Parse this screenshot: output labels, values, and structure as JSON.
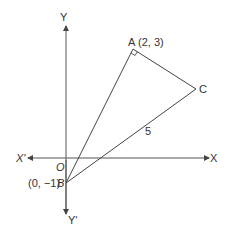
{
  "diagram": {
    "axes": {
      "y_label": "Y",
      "y_neg_label": "Y'",
      "x_label": "X",
      "x_neg_label": "X'",
      "origin_label": "O"
    },
    "points": {
      "A": {
        "name": "A",
        "coords": "(2, 3)"
      },
      "B": {
        "name": "B",
        "coords": "(0, −1)"
      },
      "C": {
        "name": "C"
      }
    },
    "edge_labels": {
      "BC": "5"
    },
    "right_angle_at": "A",
    "colors": {
      "line": "#444444",
      "text": "#333333"
    }
  }
}
